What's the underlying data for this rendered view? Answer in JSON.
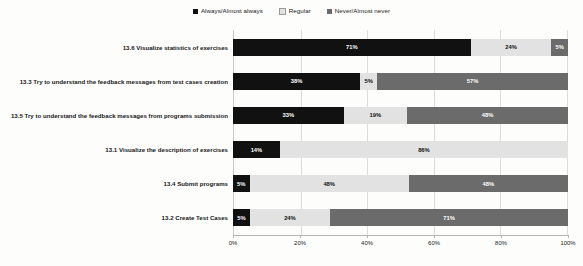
{
  "chart_data": {
    "type": "bar",
    "orientation": "horizontal",
    "stacked": true,
    "title": "",
    "xlabel": "",
    "ylabel": "",
    "xlim": [
      0,
      100
    ],
    "grid": true,
    "legend_position": "top",
    "xtick_labels": [
      "0%",
      "20%",
      "40%",
      "60%",
      "80%",
      "100%"
    ],
    "xticks": [
      0,
      20,
      40,
      60,
      80,
      100
    ],
    "categories": [
      "13.6 Visualize statistics of exercises",
      "13.3 Try to understand the feedback messages from test cases creation",
      "13.5 Try to understand the feedback messages from programs submission",
      "13.1 Visualize the description of exercises",
      "13.4 Submit programs",
      "13.2 Create Test Cases"
    ],
    "series": [
      {
        "name": "Always/Almost always",
        "color": "#111111",
        "values": [
          71,
          38,
          33,
          14,
          5,
          5
        ],
        "labels": [
          "71%",
          "38%",
          "33%",
          "14%",
          "5%",
          "5%"
        ]
      },
      {
        "name": "Regular",
        "color": "#e2e2e2",
        "values": [
          24,
          5,
          19,
          86,
          48,
          24
        ],
        "labels": [
          "24%",
          "5%",
          "19%",
          "86%",
          "48%",
          "24%"
        ]
      },
      {
        "name": "Never/Almost never",
        "color": "#6b6b6b",
        "values": [
          5,
          57,
          48,
          0,
          48,
          71
        ],
        "labels": [
          "5%",
          "57%",
          "48%",
          "",
          "48%",
          "71%"
        ]
      }
    ]
  }
}
